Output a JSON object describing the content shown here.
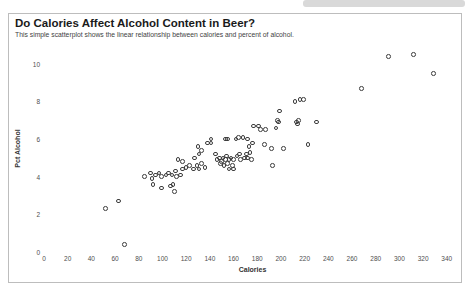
{
  "chart_data": {
    "type": "scatter",
    "title": "Do Calories Affect Alcohol Content in Beer?",
    "subtitle": "This simple scatterplot shows the linear relationship between calories and percent of alcohol.",
    "xlabel": "Calories",
    "ylabel": "Pct Alcohol",
    "xlim": [
      0,
      352
    ],
    "ylim": [
      0,
      11
    ],
    "x_ticks": [
      0,
      20,
      40,
      60,
      80,
      100,
      120,
      140,
      160,
      180,
      200,
      220,
      240,
      260,
      280,
      300,
      320,
      340
    ],
    "y_ticks": [
      0,
      2,
      4,
      6,
      8,
      10
    ],
    "grid": false,
    "legend": "none",
    "marker": {
      "shape": "open-circle",
      "stroke_color": "#3c3c3c",
      "size_px": 4.6
    },
    "points": [
      [
        52,
        2.3
      ],
      [
        63,
        2.7
      ],
      [
        68,
        0.4
      ],
      [
        85,
        4.0
      ],
      [
        90,
        4.2
      ],
      [
        91,
        3.9
      ],
      [
        92,
        3.6
      ],
      [
        94,
        4.1
      ],
      [
        97,
        4.2
      ],
      [
        99,
        3.4
      ],
      [
        99,
        4.0
      ],
      [
        103,
        4.1
      ],
      [
        105,
        4.2
      ],
      [
        107,
        3.5
      ],
      [
        108,
        4.1
      ],
      [
        109,
        3.6
      ],
      [
        110,
        3.2
      ],
      [
        111,
        4.3
      ],
      [
        112,
        4.0
      ],
      [
        113,
        4.9
      ],
      [
        115,
        4.1
      ],
      [
        117,
        4.4
      ],
      [
        117,
        4.8
      ],
      [
        120,
        4.5
      ],
      [
        123,
        4.6
      ],
      [
        126,
        4.4
      ],
      [
        127,
        5.0
      ],
      [
        129,
        4.6
      ],
      [
        131,
        4.4
      ],
      [
        133,
        4.7
      ],
      [
        136,
        4.5
      ],
      [
        130,
        5.6
      ],
      [
        131,
        5.2
      ],
      [
        133,
        5.4
      ],
      [
        138,
        5.8
      ],
      [
        141,
        5.8
      ],
      [
        141,
        6.0
      ],
      [
        145,
        5.2
      ],
      [
        146,
        4.9
      ],
      [
        148,
        5.0
      ],
      [
        149,
        4.7
      ],
      [
        150,
        4.8
      ],
      [
        151,
        5.0
      ],
      [
        152,
        4.6
      ],
      [
        153,
        6.0
      ],
      [
        153,
        4.9
      ],
      [
        154,
        5.1
      ],
      [
        155,
        6.0
      ],
      [
        155,
        4.7
      ],
      [
        156,
        4.9
      ],
      [
        156,
        4.4
      ],
      [
        158,
        5.0
      ],
      [
        159,
        4.6
      ],
      [
        160,
        4.4
      ],
      [
        160,
        4.9
      ],
      [
        162,
        6.0
      ],
      [
        163,
        5.1
      ],
      [
        164,
        6.1
      ],
      [
        165,
        5.2
      ],
      [
        166,
        4.9
      ],
      [
        168,
        6.1
      ],
      [
        169,
        5.0
      ],
      [
        171,
        5.2
      ],
      [
        172,
        6.0
      ],
      [
        172,
        5.0
      ],
      [
        173,
        5.6
      ],
      [
        174,
        5.3
      ],
      [
        175,
        4.9
      ],
      [
        176,
        5.8
      ],
      [
        186,
        5.7
      ],
      [
        192,
        5.5
      ],
      [
        193,
        4.6
      ],
      [
        202,
        5.5
      ],
      [
        223,
        5.7
      ],
      [
        177,
        6.7
      ],
      [
        181,
        6.7
      ],
      [
        183,
        6.5
      ],
      [
        187,
        6.5
      ],
      [
        196,
        6.6
      ],
      [
        197,
        7.0
      ],
      [
        198,
        6.9
      ],
      [
        199,
        7.5
      ],
      [
        212,
        8.0
      ],
      [
        213,
        6.9
      ],
      [
        214,
        6.8
      ],
      [
        215,
        7.0
      ],
      [
        216,
        8.1
      ],
      [
        219,
        8.1
      ],
      [
        230,
        6.9
      ],
      [
        268,
        8.7
      ],
      [
        291,
        10.4
      ],
      [
        312,
        10.5
      ],
      [
        329,
        9.5
      ]
    ]
  }
}
